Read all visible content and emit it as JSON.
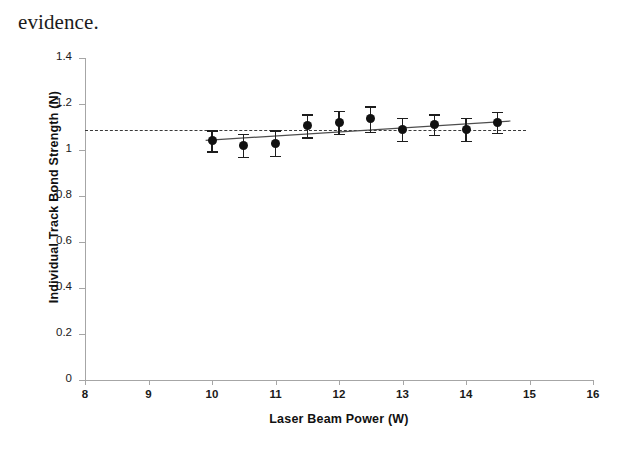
{
  "page": {
    "body_text": "evidence."
  },
  "chart_data": {
    "type": "scatter",
    "title": "",
    "xlabel": "Laser Beam Power (W)",
    "ylabel": "Individual Track Bond Strength (N)",
    "xlim": [
      8,
      16
    ],
    "ylim": [
      0,
      1.4
    ],
    "xticks": [
      8,
      9,
      10,
      11,
      12,
      13,
      14,
      15,
      16
    ],
    "yticks": [
      0,
      0.2,
      0.4,
      0.6,
      0.8,
      1,
      1.2,
      1.4
    ],
    "xtick_labels": [
      "8",
      "9",
      "10",
      "11",
      "12",
      "13",
      "14",
      "15",
      "16"
    ],
    "ytick_labels": [
      "0",
      "0.2",
      "0.4",
      "0.6",
      "0.8",
      "1",
      "1.2",
      "1.4"
    ],
    "grid": false,
    "legend": "none",
    "marker": "filled-circle",
    "marker_color": "#111111",
    "error_bar_color": "#1d1d1d",
    "x": [
      10,
      10.5,
      11,
      11.5,
      12,
      12.5,
      13,
      13.5,
      14,
      14.5
    ],
    "y": [
      1.04,
      1.02,
      1.03,
      1.105,
      1.12,
      1.135,
      1.09,
      1.11,
      1.09,
      1.12
    ],
    "yerr": [
      0.045,
      0.05,
      0.055,
      0.05,
      0.05,
      0.055,
      0.05,
      0.045,
      0.05,
      0.045
    ],
    "series": [
      {
        "name": "Individual track bond strength",
        "values": [
          1.04,
          1.02,
          1.03,
          1.105,
          1.12,
          1.135,
          1.09,
          1.11,
          1.09,
          1.12
        ]
      }
    ],
    "trend_line": {
      "type": "linear-fit",
      "color": "#4d4d4d",
      "x_start": 9.9,
      "y_start": 1.042,
      "x_end": 14.7,
      "y_end": 1.126
    },
    "reference_line": {
      "type": "horizontal-dashed",
      "value": 1.085,
      "color": "#3a3a3a",
      "x_start": 8,
      "x_end": 14.95
    }
  }
}
